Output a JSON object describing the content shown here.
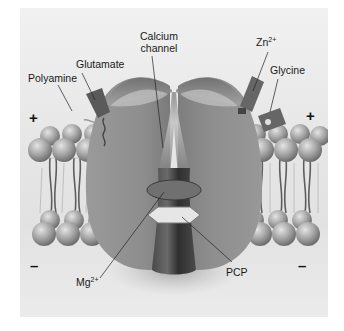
{
  "figure": {
    "labels": {
      "calcium_channel_line1": "Calcium",
      "calcium_channel_line2": "channel",
      "glutamate": "Glutamate",
      "polyamine": "Polyamine",
      "zinc": "Zn",
      "zinc_charge": "2+",
      "glycine": "Glycine",
      "magnesium": "Mg",
      "magnesium_charge": "2+",
      "pcp": "PCP"
    },
    "charges": {
      "extracellular_left": "+",
      "extracellular_right": "+",
      "intracellular_left": "–",
      "intracellular_right": "–"
    },
    "colors": {
      "background": "#e6e6e6",
      "protein": "#8c8c8c",
      "protein_dark": "#5a5a5a",
      "channel_pore": "#3f3f3f",
      "lipid_head": "#a8a8a8",
      "pcp_site": "#e8e8e8",
      "label_text": "#1a1a1a"
    }
  }
}
